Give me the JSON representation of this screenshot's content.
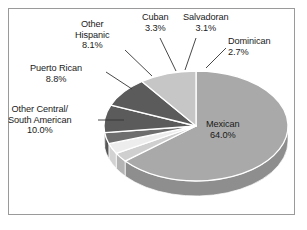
{
  "chart_data": {
    "type": "pie",
    "title": "",
    "subtitle": "",
    "xlabel": "",
    "ylabel": "",
    "legend_position": "none",
    "grid": false,
    "units": "percent",
    "categories": [
      "Mexican",
      "Dominican",
      "Salvadoran",
      "Cuban",
      "Other Hispanic",
      "Puerto Rican",
      "Other Central/South American"
    ],
    "values": [
      64.0,
      2.7,
      3.1,
      3.3,
      8.1,
      8.8,
      10.0
    ],
    "slices": [
      {
        "name": "Mexican",
        "value": 64.0,
        "value_label": "64.0%",
        "label_line1": "Mexican",
        "label_line2": "64.0%",
        "color": "#a9a9a9",
        "side_color": "#8e8e8e",
        "label_placement": "inside",
        "leader_line": false
      },
      {
        "name": "Dominican",
        "value": 2.7,
        "value_label": "2.7%",
        "label_line1": "Dominican",
        "label_line2": "2.7%",
        "color": "#cfcfcf",
        "side_color": "#b4b4b4",
        "label_placement": "outside",
        "leader_line": true
      },
      {
        "name": "Salvadoran",
        "value": 3.1,
        "value_label": "3.1%",
        "label_line1": "Salvadoran",
        "label_line2": "3.1%",
        "color": "#ededed",
        "side_color": "#d2d2d2",
        "label_placement": "outside",
        "leader_line": true
      },
      {
        "name": "Cuban",
        "value": 3.3,
        "value_label": "3.3%",
        "label_line1": "Cuban",
        "label_line2": "3.3%",
        "color": "#6e6e6e",
        "side_color": "#575757",
        "label_placement": "outside",
        "leader_line": true
      },
      {
        "name": "Other Hispanic",
        "value": 8.1,
        "value_label": "8.1%",
        "label_line1": "Other",
        "label_line2": "Hispanic",
        "label_line3": "8.1%",
        "color": "#5b5b5b",
        "side_color": "#484848",
        "label_placement": "outside",
        "leader_line": true
      },
      {
        "name": "Puerto Rican",
        "value": 8.8,
        "value_label": "8.8%",
        "label_line1": "Puerto Rican",
        "label_line2": "8.8%",
        "color": "#5b5b5b",
        "side_color": "#484848",
        "label_placement": "outside",
        "leader_line": true
      },
      {
        "name": "Other Central/South American",
        "value": 10.0,
        "value_label": "10.0%",
        "label_line1": "Other Central/",
        "label_line2": "South American",
        "label_line3": "10.0%",
        "color": "#c6c6c6",
        "side_color": "#ababab",
        "label_placement": "outside",
        "leader_line": true
      }
    ],
    "total": 100.0
  },
  "labels": {
    "mexican": "Mexican\n64.0%",
    "dominican": "Dominican\n2.7%",
    "salvadoran": "Salvadoran\n3.1%",
    "cuban": "Cuban\n3.3%",
    "other_hispanic": "Other\nHispanic\n8.1%",
    "puerto_rican": "Puerto Rican\n8.8%",
    "other_central_south_american": "Other Central/\nSouth American\n10.0%"
  },
  "style": {
    "background_color": "#ffffff",
    "frame_border_color": "#9a9a9a",
    "text_color": "#1a1a1a",
    "leader_line_color": "#333333",
    "slice_edge_color": "#ffffff"
  }
}
